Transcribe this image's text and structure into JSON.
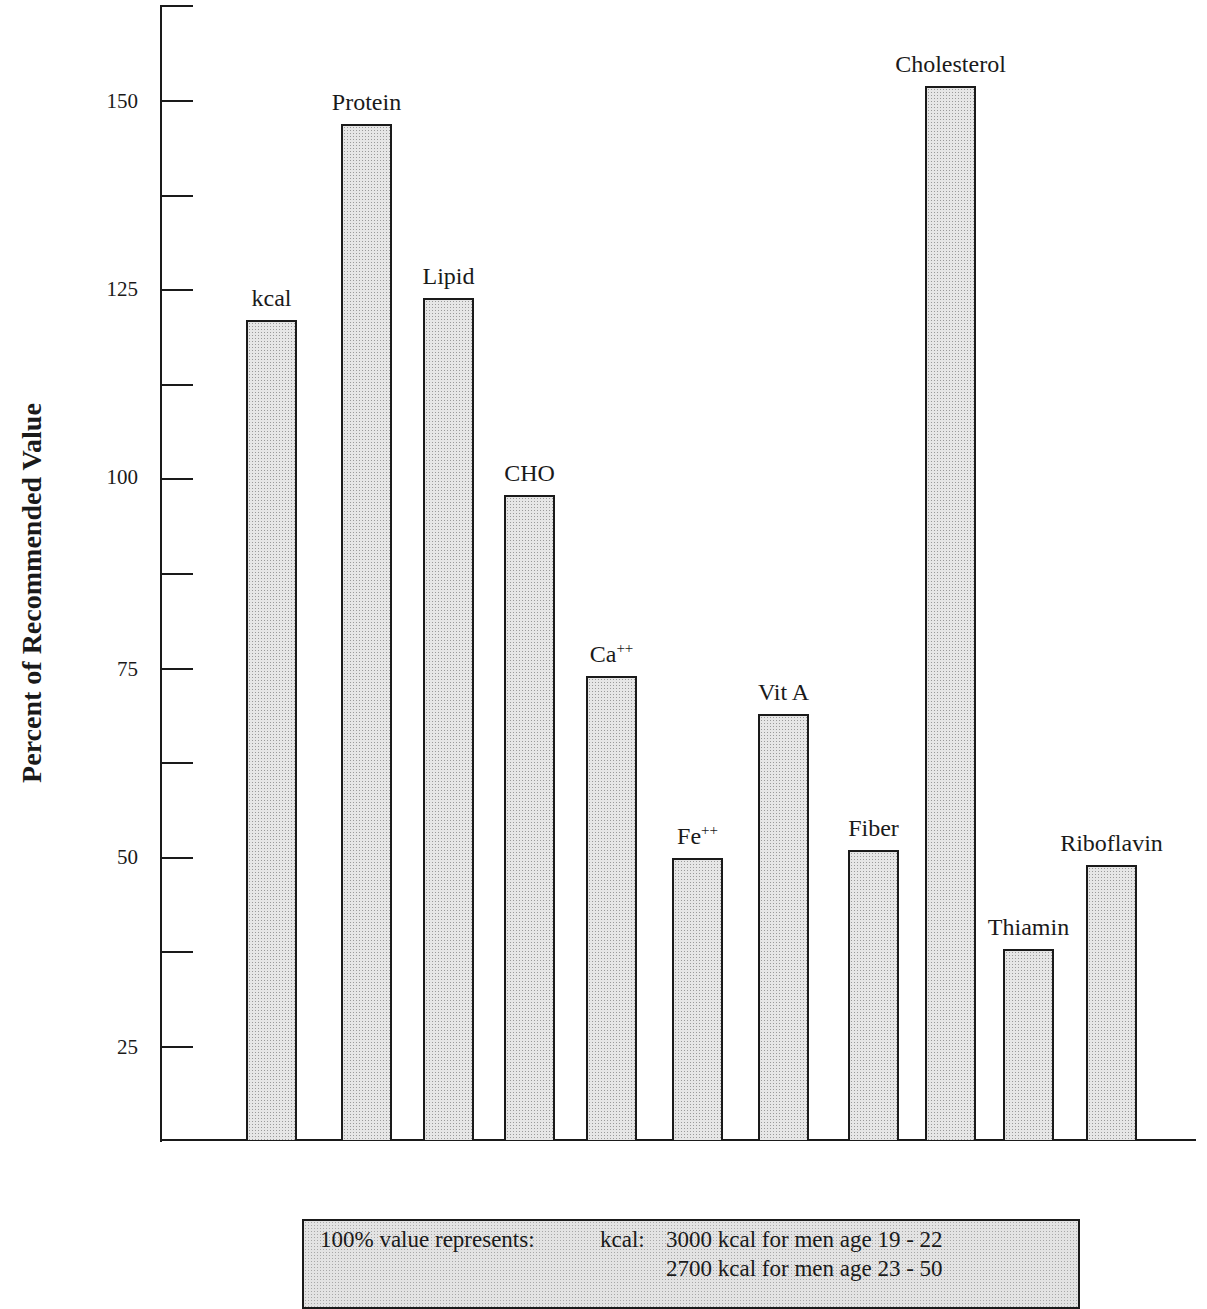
{
  "chart_data": {
    "type": "bar",
    "title": "",
    "xlabel": "",
    "ylabel": "Percent of Recommended Value",
    "ylim": [
      12.5,
      162.5
    ],
    "yticks_labeled": [
      25,
      50,
      75,
      100,
      125,
      150
    ],
    "yticks_minor": [
      37.5,
      62.5,
      87.5,
      112.5,
      137.5,
      162.5
    ],
    "grid": false,
    "legend": null,
    "categories": [
      "kcal",
      "Protein",
      "Lipid",
      "CHO",
      "Ca++",
      "Fe++",
      "Vit A",
      "Fiber",
      "Cholesterol",
      "Thiamin",
      "Riboflavin"
    ],
    "values": [
      121,
      147,
      124,
      98,
      74,
      50,
      69,
      51,
      152,
      38,
      49
    ],
    "annotations": [
      "100% value represents:  kcal:  3000 kcal for men age 19 - 22",
      "2700 kcal for men age 23 - 50"
    ]
  },
  "axis": {
    "title": "Percent of Recommended Value",
    "tick_labels": [
      "150",
      "125",
      "100",
      "75",
      "50",
      "25"
    ]
  },
  "bars": [
    {
      "label": "kcal",
      "sup": "",
      "value": 121
    },
    {
      "label": "Protein",
      "sup": "",
      "value": 147
    },
    {
      "label": "Lipid",
      "sup": "",
      "value": 124
    },
    {
      "label": "CHO",
      "sup": "",
      "value": 98
    },
    {
      "label": "Ca",
      "sup": "++",
      "value": 74
    },
    {
      "label": "Fe",
      "sup": "++",
      "value": 50
    },
    {
      "label": "Vit A",
      "sup": "",
      "value": 69
    },
    {
      "label": "Fiber",
      "sup": "",
      "value": 51
    },
    {
      "label": "Cholesterol",
      "sup": "",
      "value": 152
    },
    {
      "label": "Thiamin",
      "sup": "",
      "value": 38
    },
    {
      "label": "Riboflavin",
      "sup": "",
      "value": 49
    }
  ],
  "note": {
    "intro": "100% value represents:",
    "key": "kcal:",
    "line1": "3000 kcal for men age 19 - 22",
    "line2": "2700 kcal for men age 23 - 50"
  },
  "colors": {
    "ink": "#1a1a1a",
    "bar_fill": "#e6e6e6",
    "background": "#ffffff"
  }
}
